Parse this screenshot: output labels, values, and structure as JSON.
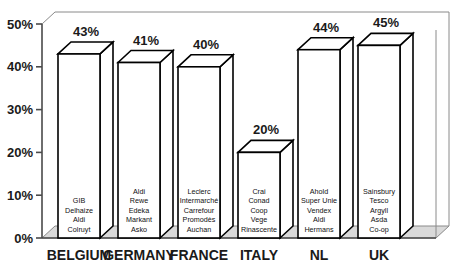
{
  "chart_data": {
    "type": "bar",
    "title": "",
    "xlabel": "",
    "ylabel": "",
    "ylim": [
      0,
      50
    ],
    "grid": false,
    "legend": "none",
    "categories": [
      "BELGIUM",
      "GERMANY",
      "FRANCE",
      "ITALY",
      "NL",
      "UK"
    ],
    "values": [
      43,
      41,
      40,
      20,
      44,
      45
    ],
    "value_labels": [
      "43%",
      "41%",
      "40%",
      "20%",
      "44%",
      "45%"
    ],
    "ytick_labels": [
      "0%",
      "10%",
      "20%",
      "30%",
      "40%",
      "50%"
    ],
    "ytick_values": [
      0,
      10,
      20,
      30,
      40,
      50
    ],
    "bar_annotations": [
      [
        "GIB",
        "Delhaize",
        "Aldi",
        "Colruyt"
      ],
      [
        "Aldi",
        "Rewe",
        "Edeka",
        "Markant",
        "Asko"
      ],
      [
        "Leclerc",
        "Intermarché",
        "Carrefour",
        "Promodès",
        "Auchan"
      ],
      [
        "Crai",
        "Conad",
        "Coop",
        "Vege",
        "Rinascente"
      ],
      [
        "Ahold",
        "Super Unie",
        "Vendex",
        "Aldi",
        "Hermans"
      ],
      [
        "Sainsbury",
        "Tesco",
        "Argyll",
        "Asda",
        "Co-op"
      ]
    ]
  },
  "colors": {
    "bar_fill": "#ffffff",
    "bar_stroke": "#000000",
    "axis": "#4a4a4a",
    "frame": "#8a8a8a",
    "floor": "#d9d9d9",
    "text": "#1a1a1a",
    "background": "#ffffff"
  }
}
